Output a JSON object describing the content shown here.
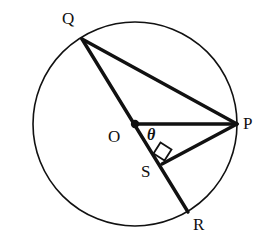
{
  "figure": {
    "kind": "circle-geometry-diagram",
    "width": 261,
    "height": 244,
    "background_color": "#ffffff",
    "stroke_color": "#111111",
    "labels": {
      "Q": "Q",
      "P": "P",
      "O": "O",
      "S": "S",
      "R": "R",
      "theta": "θ"
    },
    "points": {
      "O": {
        "x": 135,
        "y": 124,
        "role": "circle-center",
        "marked_with_dot": true
      },
      "Q": {
        "x": 82,
        "y": 39,
        "role": "point-on-circle"
      },
      "P": {
        "x": 237,
        "y": 124,
        "role": "point-on-circle"
      },
      "R": {
        "x": 188,
        "y": 212,
        "role": "point-on-circle"
      },
      "S": {
        "x": 162,
        "y": 164,
        "role": "foot-of-perpendicular-from-P-to-QR"
      }
    },
    "circle": {
      "cx": 135,
      "cy": 124,
      "r": 102,
      "stroke_width": 1.6
    },
    "segments": [
      {
        "name": "QR",
        "from": "Q",
        "to": "R",
        "stroke_width": 3.4,
        "note": "chord through center O"
      },
      {
        "name": "QP",
        "from": "Q",
        "to": "P",
        "stroke_width": 3.4
      },
      {
        "name": "OP",
        "from": "O",
        "to": "P",
        "stroke_width": 3.4,
        "note": "radius"
      },
      {
        "name": "SP",
        "from": "S",
        "to": "P",
        "stroke_width": 3.4
      }
    ],
    "angle_marks": [
      {
        "name": "theta",
        "at": "O",
        "between": [
          "OP",
          "OS"
        ],
        "label": "θ"
      },
      {
        "name": "right-angle",
        "at": "S",
        "between": [
          "SR",
          "SP"
        ],
        "label": "",
        "type": "square"
      }
    ]
  }
}
